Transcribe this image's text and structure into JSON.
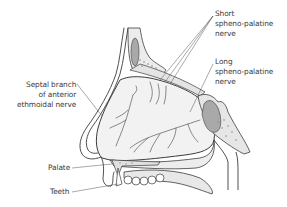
{
  "diagram": {
    "colors": {
      "outline": "#3c3c3c",
      "tissue_fill": "#ededed",
      "cavity_fill": "#f6f6f6",
      "sinus_fill": "#a9a9a9",
      "bone_dots": "#8a8a8a",
      "nerve": "#5a5a5a",
      "label_text": "#3a3a3a"
    },
    "labels": {
      "short_sphenopalatine": {
        "line1": "Short",
        "line2": "spheno-palatine",
        "line3": "nerve"
      },
      "long_sphenopalatine": {
        "line1": "Long",
        "line2": "spheno-palatine",
        "line3": "nerve"
      },
      "septal_branch": {
        "line1": "Septal branch",
        "line2": "of anterior",
        "line3": "ethmoidal nerve"
      },
      "palate": "Palate",
      "teeth": "Teeth"
    }
  }
}
